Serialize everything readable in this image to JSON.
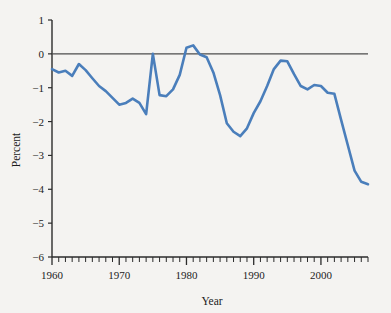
{
  "chart_data": {
    "type": "line",
    "title": "",
    "subtitle": "",
    "xlabel": "Year",
    "ylabel": "Percent",
    "xlim": [
      1960,
      2007
    ],
    "ylim": [
      -6,
      1
    ],
    "xticks": [
      1960,
      1970,
      1980,
      1990,
      2000
    ],
    "xtick_labels": [
      "1960",
      "1970",
      "1980",
      "1990",
      "2000"
    ],
    "yticks": [
      1,
      0,
      -1,
      -2,
      -3,
      -4,
      -5,
      -6
    ],
    "ytick_labels": [
      "1",
      "0",
      "−1",
      "−2",
      "−3",
      "−4",
      "−5",
      "−6"
    ],
    "minor_x_tick_interval": 1,
    "grid": false,
    "legend": null,
    "zero_line": true,
    "zero_line_color": "#4d4d4d",
    "series": [
      {
        "name": "Percent",
        "color": "#4a7ebb",
        "line_width": 2.6,
        "x": [
          1960,
          1961,
          1962,
          1963,
          1964,
          1965,
          1966,
          1967,
          1968,
          1969,
          1970,
          1971,
          1972,
          1973,
          1974,
          1975,
          1976,
          1977,
          1978,
          1979,
          1980,
          1981,
          1982,
          1983,
          1984,
          1985,
          1986,
          1987,
          1988,
          1989,
          1990,
          1991,
          1992,
          1993,
          1994,
          1995,
          1996,
          1997,
          1998,
          1999,
          2000,
          2001,
          2002,
          2003,
          2004,
          2005,
          2006,
          2007
        ],
        "y": [
          -0.45,
          -0.55,
          -0.5,
          -0.65,
          -0.3,
          -0.48,
          -0.72,
          -0.95,
          -1.1,
          -1.3,
          -1.5,
          -1.45,
          -1.32,
          -1.45,
          -1.78,
          0.0,
          -1.22,
          -1.25,
          -1.05,
          -0.62,
          0.18,
          0.25,
          -0.02,
          -0.1,
          -0.55,
          -1.22,
          -2.05,
          -2.3,
          -2.43,
          -2.2,
          -1.75,
          -1.4,
          -0.95,
          -0.45,
          -0.2,
          -0.22,
          -0.6,
          -0.95,
          -1.05,
          -0.92,
          -0.95,
          -1.15,
          -1.18,
          -1.95,
          -2.7,
          -3.45,
          -3.78,
          -3.85
        ]
      }
    ],
    "series_notes": "Smoothed annual series; minimum near -5.45 around 2005-2006, final value near -4.7 in 2007"
  },
  "axes": {
    "y_axis_title": "Percent",
    "x_axis_title": "Year"
  }
}
